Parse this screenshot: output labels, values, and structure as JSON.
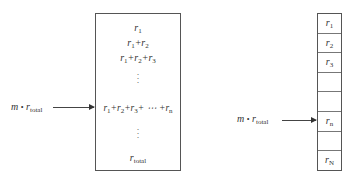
{
  "left_panel": {
    "input_label": {
      "var": "m",
      "op": "•",
      "r": "r",
      "sub": "total"
    },
    "cumulative": [
      {
        "text": "r",
        "sub": "1",
        "rest": ""
      },
      {
        "text": "r",
        "sub": "1",
        "rest": "+r",
        "sub2": "2"
      },
      {
        "text": "r",
        "sub": "1",
        "rest": "+r",
        "sub2": "2",
        "rest2": "+r",
        "sub3": "3"
      },
      {
        "ellipsis": "⋮"
      },
      {
        "text": "r",
        "sub": "1",
        "rest": "+r",
        "sub2": "2",
        "rest2": "+r",
        "sub3": "3",
        "rest3": "+ ⋯ +r",
        "sub4": "n"
      },
      {
        "ellipsis": "⋮"
      },
      {
        "text": "r",
        "sub": "total"
      }
    ]
  },
  "right_panel": {
    "input_label": {
      "var": "m",
      "op": "•",
      "r": "r",
      "sub": "total"
    },
    "cells": [
      {
        "r": "r",
        "sub": "1"
      },
      {
        "r": "r",
        "sub": "2"
      },
      {
        "r": "r",
        "sub": "3"
      },
      {
        "r": "",
        "sub": ""
      },
      {
        "r": "",
        "sub": ""
      },
      {
        "r": "r",
        "sub": "n"
      },
      {
        "r": "",
        "sub": ""
      },
      {
        "r": "r",
        "sub": "N"
      }
    ]
  }
}
